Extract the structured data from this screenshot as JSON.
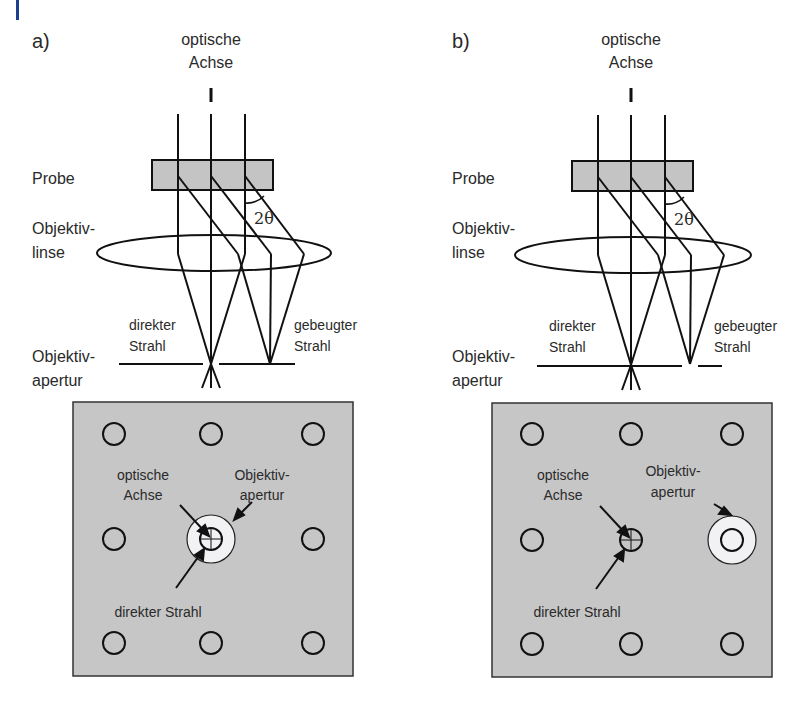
{
  "accent_mark": {
    "color": "#1a3f8f"
  },
  "colors": {
    "specimen_fill": "#c4c4c4",
    "screen_fill": "#c6c6c6",
    "aperture_fill": "#f2f2f4",
    "line": "#111111"
  },
  "panels": [
    {
      "id": "a",
      "label": "a)",
      "optical_axis_label": [
        "optische",
        "Achse"
      ],
      "specimen_label": "Probe",
      "lens_label": [
        "Objektiv-",
        "linse"
      ],
      "aperture_label": [
        "Objektiv-",
        "apertur"
      ],
      "angle_label": "2θ",
      "direct_beam_label": [
        "direkter",
        "Strahl"
      ],
      "diffracted_beam_label": [
        "gebeugter",
        "Strahl"
      ],
      "screen": {
        "optical_axis_label": [
          "optische",
          "Achse"
        ],
        "aperture_label": [
          "Objektiv-",
          "apertur"
        ],
        "direct_beam_label": "direkter Strahl",
        "aperture_position": "center"
      }
    },
    {
      "id": "b",
      "label": "b)",
      "optical_axis_label": [
        "optische",
        "Achse"
      ],
      "specimen_label": "Probe",
      "lens_label": [
        "Objektiv-",
        "linse"
      ],
      "aperture_label": [
        "Objektiv-",
        "apertur"
      ],
      "angle_label": "2θ",
      "direct_beam_label": [
        "direkter",
        "Strahl"
      ],
      "diffracted_beam_label": [
        "gebeugter",
        "Strahl"
      ],
      "screen": {
        "optical_axis_label": [
          "optische",
          "Achse"
        ],
        "aperture_label": [
          "Objektiv-",
          "apertur"
        ],
        "direct_beam_label": "direkter Strahl",
        "aperture_position": "diffracted-spot"
      }
    }
  ]
}
